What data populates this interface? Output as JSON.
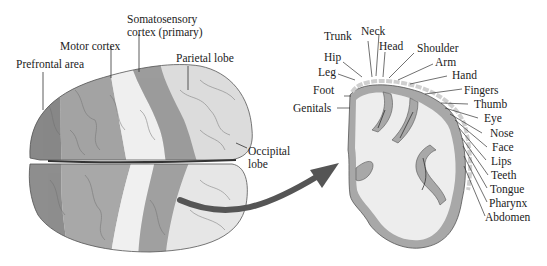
{
  "figure": {
    "left_panel": {
      "title": "Top view of cerebral hemispheres",
      "labels": {
        "prefrontal": "Prefrontal area",
        "motor": "Motor cortex",
        "somatosensory_line1": "Somatosensory",
        "somatosensory_line2": "cortex (primary)",
        "parietal": "Parietal lobe",
        "occipital_line1": "Occipital",
        "occipital_line2": "lobe"
      }
    },
    "right_panel": {
      "title": "Coronal section of somatosensory cortex",
      "labels": {
        "trunk": "Trunk",
        "neck": "Neck",
        "head": "Head",
        "shoulder": "Shoulder",
        "hip": "Hip",
        "arm": "Arm",
        "leg": "Leg",
        "hand": "Hand",
        "foot": "Foot",
        "fingers": "Fingers",
        "thumb": "Thumb",
        "genitals": "Genitals",
        "eye": "Eye",
        "nose": "Nose",
        "face": "Face",
        "lips": "Lips",
        "teeth": "Teeth",
        "tongue": "Tongue",
        "pharynx": "Pharynx",
        "abdomen": "Abdomen"
      }
    },
    "colors": {
      "prefrontal": "#8a8a8a",
      "motor": "#a6a6a6",
      "somatosensory": "#ececec",
      "parietal": "#dedede",
      "grey_matter": "#a9a9a9",
      "white_matter": "#eeeeee",
      "arrow": "#555555",
      "text": "#222222"
    }
  }
}
